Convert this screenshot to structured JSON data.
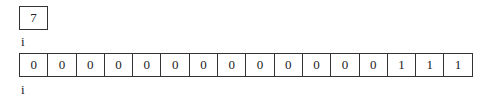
{
  "value_box": {
    "value": "7"
  },
  "pointer_top": {
    "label": "i"
  },
  "array": {
    "cells": [
      "0",
      "0",
      "0",
      "0",
      "0",
      "0",
      "0",
      "0",
      "0",
      "0",
      "0",
      "0",
      "0",
      "1",
      "1",
      "1"
    ]
  },
  "pointer_bottom": {
    "label": "i"
  }
}
